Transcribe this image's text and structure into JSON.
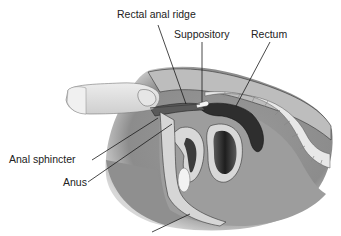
{
  "diagram": {
    "type": "medical-illustration",
    "labels": [
      {
        "id": "rectal-anal-ridge",
        "text": "Rectal anal ridge",
        "x": 117,
        "y": 9
      },
      {
        "id": "suppository",
        "text": "Suppository",
        "x": 174,
        "y": 29
      },
      {
        "id": "rectum",
        "text": "Rectum",
        "x": 251,
        "y": 29
      },
      {
        "id": "anal-sphincter",
        "text": "Anal sphincter",
        "x": 9,
        "y": 154
      },
      {
        "id": "anus",
        "text": "Anus",
        "x": 63,
        "y": 177
      }
    ],
    "colors": {
      "outer_body": "#8a8a8a",
      "skin_light": "#d9d9d9",
      "glove": "#e4e4e4",
      "dark_tissue": "#3a3a3a",
      "mid_tissue": "#a8a8a8",
      "spine": "#efefef",
      "line": "#222222"
    }
  }
}
